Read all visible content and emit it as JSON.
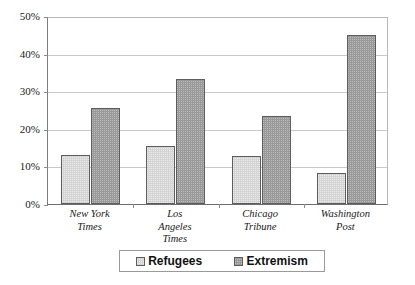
{
  "chart_data": {
    "type": "bar",
    "title": "",
    "subtitle": "",
    "xlabel": "",
    "ylabel": "",
    "categories": [
      "New York Times",
      "Los Angeles Times",
      "Chicago Tribune",
      "Washington Post"
    ],
    "category_lines": [
      [
        "New York",
        "Times"
      ],
      [
        "Los",
        "Angeles",
        "Times"
      ],
      [
        "Chicago",
        "Tribune"
      ],
      [
        "Washington",
        "Post"
      ]
    ],
    "series": [
      {
        "name": "Refugees",
        "values": [
          13.0,
          15.4,
          12.8,
          8.2
        ],
        "color": "#d4d4d4"
      },
      {
        "name": "Extremism",
        "values": [
          25.6,
          33.3,
          23.3,
          44.9
        ],
        "color": "#9a9a9a"
      }
    ],
    "ylim": [
      0,
      50
    ],
    "ytick_values": [
      0,
      10,
      20,
      30,
      40,
      50
    ],
    "ytick_labels": [
      "0%",
      "10%",
      "20%",
      "30%",
      "40%",
      "50%"
    ],
    "grid": true,
    "grid_axis": "y",
    "legend_position": "bottom",
    "value_format": "percent",
    "border_color": "#5d5d5d",
    "gridline_color": "#c9c9c9",
    "axis_color": "#6e6e6e",
    "background": "#ffffff"
  }
}
